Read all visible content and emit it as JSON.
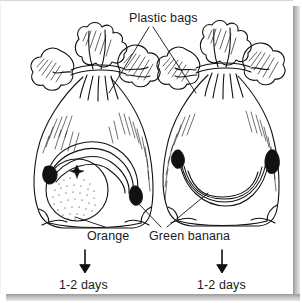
{
  "figure": {
    "title_label": "Plastic bags",
    "colors": {
      "ink": "#111111",
      "paper": "#ffffff",
      "shadow": "#9a9a9a"
    },
    "callouts": [
      {
        "name": "plastic-bags",
        "text": "Plastic bags"
      },
      {
        "name": "orange",
        "text": "Orange"
      },
      {
        "name": "green-banana",
        "text": "Green banana"
      }
    ],
    "bags": [
      {
        "name": "left-bag",
        "contents": [
          "Orange",
          "Green banana"
        ],
        "duration_label": "1-2 days"
      },
      {
        "name": "right-bag",
        "contents": [
          "Green banana"
        ],
        "duration_label": "1-2 days"
      }
    ],
    "labels": {
      "plastic_bags": "Plastic bags",
      "orange": "Orange",
      "green_banana": "Green banana",
      "days_left": "1-2 days",
      "days_right": "1-2 days"
    }
  }
}
